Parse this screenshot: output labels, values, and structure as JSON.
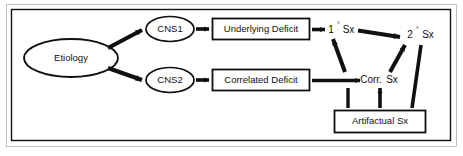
{
  "figure": {
    "background_color": "#ffffff",
    "line_color": "#101010",
    "frame": {
      "outer_border_color": "#b8b8b8",
      "inner_border_color": "#101010"
    }
  },
  "nodes": {
    "etiology": {
      "label": "Etiology",
      "shape": "ellipse"
    },
    "cns1": {
      "label": "CNS1",
      "shape": "ellipse"
    },
    "cns2": {
      "label": "CNS2",
      "shape": "ellipse"
    },
    "underlying_deficit": {
      "label": "Underlying Deficit",
      "shape": "rectangle"
    },
    "correlated_deficit": {
      "label": "Correlated Deficit",
      "shape": "rectangle"
    },
    "artifactual_sx": {
      "label": "Artifactual Sx",
      "shape": "rectangle"
    },
    "primary_sx": {
      "number": "1",
      "degree": "°",
      "label": "Sx",
      "shape": "text"
    },
    "secondary_sx": {
      "number": "2",
      "degree": "°",
      "label": "Sx",
      "shape": "text"
    },
    "correlated_sx": {
      "label": "Corr.",
      "label2": "Sx",
      "shape": "text"
    }
  },
  "edges": [
    {
      "from": "etiology",
      "to": "cns1",
      "style": "solid-arrow"
    },
    {
      "from": "etiology",
      "to": "cns2",
      "style": "solid-arrow"
    },
    {
      "from": "cns1",
      "to": "underlying_deficit",
      "style": "solid-arrow"
    },
    {
      "from": "cns2",
      "to": "correlated_deficit",
      "style": "solid-arrow"
    },
    {
      "from": "underlying_deficit",
      "to": "primary_sx",
      "style": "solid-arrow"
    },
    {
      "from": "correlated_deficit",
      "to": "correlated_sx",
      "style": "solid-arrow"
    },
    {
      "from": "primary_sx",
      "to": "secondary_sx",
      "style": "solid-arrow"
    },
    {
      "from": "correlated_sx",
      "to": "primary_sx",
      "style": "solid-arrow"
    },
    {
      "from": "correlated_sx",
      "to": "secondary_sx",
      "style": "solid-arrow"
    },
    {
      "from": "artifactual_sx",
      "to": "correlated_sx",
      "style": "solid-arrow"
    },
    {
      "from": "artifactual_sx",
      "to": "correlated_sx",
      "style": "plain-line"
    },
    {
      "from": "artifactual_sx",
      "to": "secondary_sx",
      "style": "solid-line"
    }
  ]
}
